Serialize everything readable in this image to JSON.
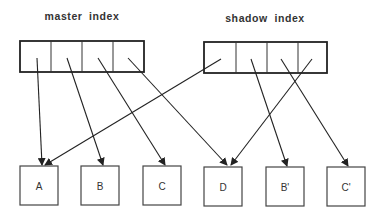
{
  "diagram": {
    "master_index": {
      "label": "master index",
      "cells": 4
    },
    "shadow_index": {
      "label": "shadow index",
      "cells": 4
    },
    "leaves": [
      {
        "id": "A",
        "label": "A"
      },
      {
        "id": "B",
        "label": "B"
      },
      {
        "id": "C",
        "label": "C"
      },
      {
        "id": "D",
        "label": "D"
      },
      {
        "id": "B-prime",
        "label": "B'"
      },
      {
        "id": "C-prime",
        "label": "C'"
      }
    ],
    "edges": [
      {
        "from": "master_index.cell1",
        "to": "A"
      },
      {
        "from": "master_index.cell2",
        "to": "B"
      },
      {
        "from": "master_index.cell3",
        "to": "C"
      },
      {
        "from": "master_index.cell4",
        "to": "D"
      },
      {
        "from": "shadow_index.cell1",
        "to": "A"
      },
      {
        "from": "shadow_index.cell2",
        "to": "B'"
      },
      {
        "from": "shadow_index.cell3",
        "to": "C'"
      },
      {
        "from": "shadow_index.cell4",
        "to": "D"
      }
    ],
    "colors": {
      "stroke": "#222222",
      "text": "#333333",
      "background": "#ffffff"
    }
  }
}
